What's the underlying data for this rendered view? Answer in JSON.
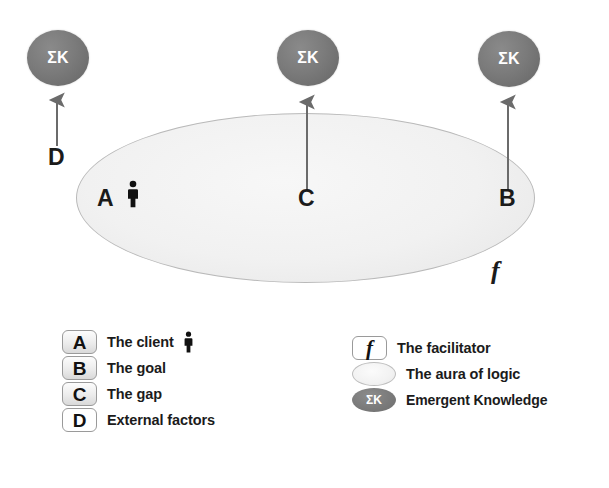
{
  "diagram": {
    "colors": {
      "node_gray": "#787878",
      "aura_fill": "#f0f0f0",
      "aura_stroke": "#b9b9b9",
      "arrow_gray": "#6b6b6b",
      "text_black": "#1b1b1b"
    },
    "emergent_nodes": [
      {
        "label": "ΣK",
        "name": "emergent-knowledge-node-d",
        "x": 27,
        "y": 30
      },
      {
        "label": "ΣK",
        "name": "emergent-knowledge-node-c",
        "x": 277,
        "y": 30
      },
      {
        "label": "ΣK",
        "name": "emergent-knowledge-node-b",
        "x": 478,
        "y": 31
      }
    ],
    "arrows": [
      {
        "name": "arrow-d",
        "from_label": "D",
        "x": 57,
        "top": 93,
        "bottom": 146
      },
      {
        "name": "arrow-c",
        "from_label": "C",
        "x": 307,
        "top": 95,
        "bottom": 190
      },
      {
        "name": "arrow-b",
        "from_label": "B",
        "x": 508,
        "top": 95,
        "bottom": 190
      }
    ],
    "labels": [
      {
        "text": "D",
        "name": "label-d",
        "x": 48,
        "y": 146
      },
      {
        "text": "A",
        "name": "label-a",
        "x": 97,
        "y": 187
      },
      {
        "text": "C",
        "name": "label-c",
        "x": 298,
        "y": 187
      },
      {
        "text": "B",
        "name": "label-b",
        "x": 499,
        "y": 187
      },
      {
        "text": "f",
        "name": "label-f",
        "x": 491,
        "y": 258
      }
    ],
    "aura": {
      "name": "aura-of-logic-ellipse",
      "x": 76,
      "y": 113,
      "width": 459,
      "height": 170
    },
    "client_figure": {
      "name": "client-person-icon",
      "x": 125,
      "y": 180
    }
  },
  "legend_left": {
    "items": [
      {
        "key": "A",
        "label": "The client",
        "has_person_icon": true,
        "filled": true
      },
      {
        "key": "B",
        "label": "The goal",
        "has_person_icon": false,
        "filled": true
      },
      {
        "key": "C",
        "label": "The gap",
        "has_person_icon": false,
        "filled": true
      },
      {
        "key": "D",
        "label": "External factors",
        "has_person_icon": false,
        "filled": false
      }
    ]
  },
  "legend_right": {
    "items": [
      {
        "key": "f",
        "label": "The facilitator",
        "swatch": "box-f"
      },
      {
        "key": "",
        "label": "The aura of logic",
        "swatch": "ellipse-aura"
      },
      {
        "key": "ΣK",
        "label": "Emergent Knowledge",
        "swatch": "ellipse-sk"
      }
    ]
  }
}
